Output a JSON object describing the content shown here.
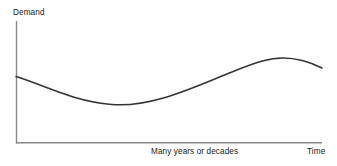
{
  "chart_data": {
    "type": "line",
    "title": "",
    "ylabel": "Demand",
    "xlabel": "Time",
    "x_caption": "Many years or decades",
    "grid": false,
    "legend": null,
    "axis_color": "#8a8a8a",
    "line_color": "#333333",
    "background": "#ffffff",
    "xlim": [
      0,
      100
    ],
    "ylim": [
      0,
      100
    ],
    "x_tick_labels": [],
    "y_tick_labels": [],
    "series": [
      {
        "name": "Demand",
        "description": "Long-wave demand cycle: declines from an initial level to a trough, rises through an inflection to a peak, then begins to decline",
        "x": [
          0,
          5,
          10,
          15,
          20,
          25,
          30,
          35,
          40,
          45,
          50,
          55,
          60,
          65,
          70,
          75,
          80,
          85,
          90,
          95,
          100
        ],
        "y": [
          55,
          52,
          48,
          44,
          41,
          38,
          35,
          33,
          32,
          33,
          36,
          41,
          47,
          54,
          61,
          68,
          73,
          77,
          79,
          78,
          73
        ]
      }
    ],
    "annotations": {
      "trough_x": 40,
      "trough_y": 32,
      "peak_x": 88,
      "peak_y": 79,
      "start_y": 55,
      "end_y": 73
    },
    "geometry": {
      "axis_origin_x": 16,
      "axis_origin_y": 143,
      "axis_top_y": 21,
      "axis_right_x": 322,
      "curve_path": "M 16,76.5 C 44,85 72,101 112,104.5 C 152,108 196,86 232,72 C 258,61.5 270,58 283,58 C 300,58 312,63 322,68"
    }
  }
}
